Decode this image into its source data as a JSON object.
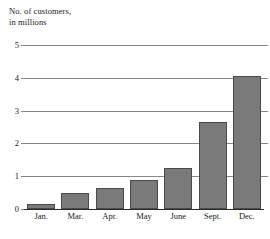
{
  "chart_data": {
    "type": "bar",
    "title": "No. of customers, in millions",
    "title_lines": [
      "No. of customers,",
      "in millions"
    ],
    "xlabel": "",
    "ylabel": "",
    "categories": [
      "Jan.",
      "Mar.",
      "Apr.",
      "May",
      "June",
      "Sept.",
      "Dec."
    ],
    "values": [
      0.15,
      0.5,
      0.65,
      0.88,
      1.25,
      2.65,
      4.05
    ],
    "ylim": [
      0,
      5
    ],
    "ytick_labels": [
      "0",
      "1",
      "2",
      "3",
      "4",
      "5"
    ],
    "ytick_values": [
      0,
      1,
      2,
      3,
      4,
      5
    ],
    "grid": true,
    "legend": false,
    "bar_color": "#7a7a7a",
    "bar_border_color": "#4a4a4a",
    "gridline_color": "#888888",
    "axis_color": "#2b2b2b",
    "background": "#ffffff"
  }
}
